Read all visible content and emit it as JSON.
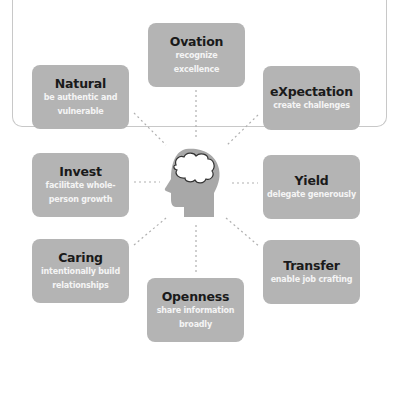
{
  "diagram": {
    "center": {
      "icon": "head-with-brain-icon"
    },
    "nodes": [
      {
        "id": "ovation",
        "title": "Ovation",
        "desc": "recognize excellence"
      },
      {
        "id": "natural",
        "title": "Natural",
        "desc": "be authentic and vulnerable"
      },
      {
        "id": "expectation",
        "title": "eXpectation",
        "desc": "create challenges"
      },
      {
        "id": "invest",
        "title": "Invest",
        "desc": "facilitate whole-person growth"
      },
      {
        "id": "yield",
        "title": "Yield",
        "desc": "delegate generously"
      },
      {
        "id": "caring",
        "title": "Caring",
        "desc": "intentionally build relationships"
      },
      {
        "id": "transfer",
        "title": "Transfer",
        "desc": "enable job crafting"
      },
      {
        "id": "openness",
        "title": "Openness",
        "desc": "share information broadly"
      }
    ],
    "colors": {
      "box_fill": "#b4b4b4",
      "title_text": "#1a1a1a",
      "desc_text": "#f4f4f4",
      "connector": "#b0b0b0",
      "head_fill": "#a8a8a8",
      "frame_border": "#c8c8c8"
    }
  }
}
